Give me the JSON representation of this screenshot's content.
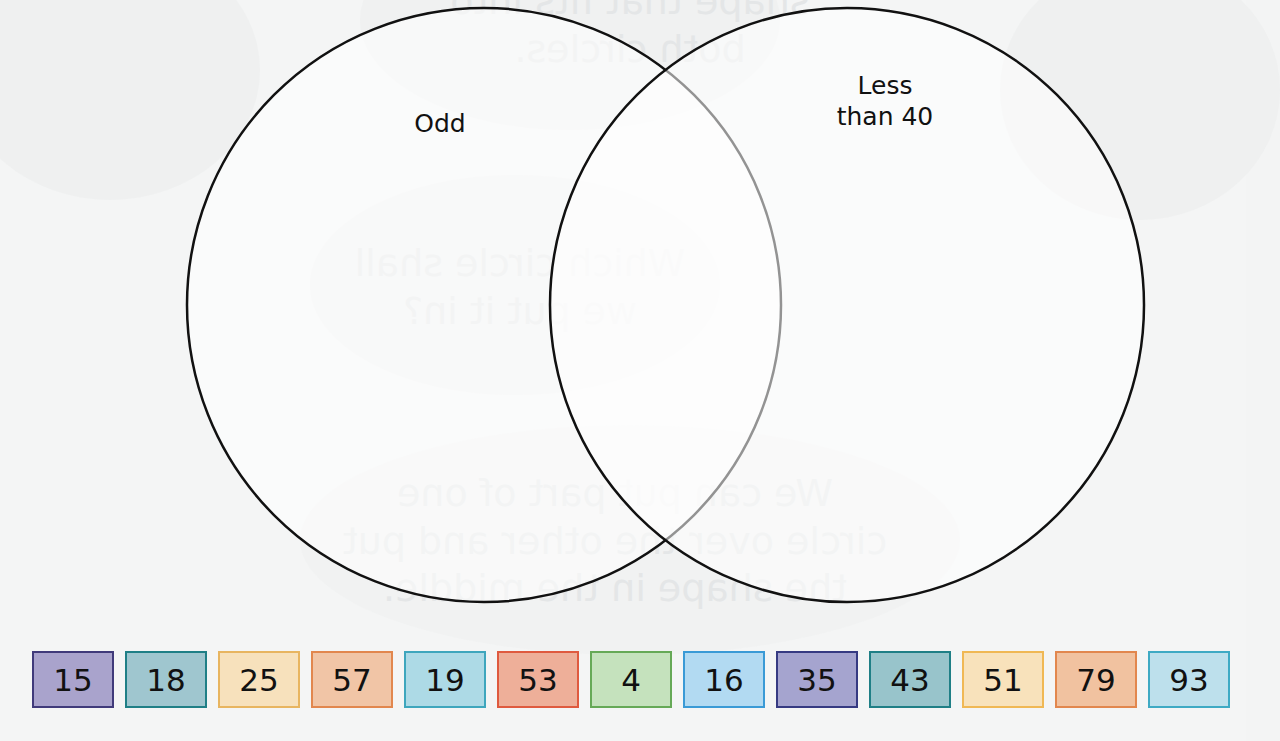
{
  "venn": {
    "left_set": {
      "label": "Odd",
      "cx": 484,
      "cy": 305,
      "r": 297
    },
    "right_set": {
      "label_line1": "Less",
      "label_line2": "than 40",
      "cx": 847,
      "cy": 305,
      "r": 297
    },
    "stroke_color": "#111111"
  },
  "background_bleed_text": {
    "top": [
      "shape that fits into",
      "both circles."
    ],
    "middle": [
      "Which circle shall",
      "we put it in?"
    ],
    "bottom": [
      "We can put part of one",
      "circle over the other and put",
      "the shape in the middle."
    ]
  },
  "number_tiles": [
    {
      "value": "15",
      "fill": "#a9a3cc",
      "border": "#403a7a"
    },
    {
      "value": "18",
      "fill": "#9fc6cf",
      "border": "#1f7f86"
    },
    {
      "value": "25",
      "fill": "#f7e1bc",
      "border": "#e8b560"
    },
    {
      "value": "57",
      "fill": "#f1c5a6",
      "border": "#e2874e"
    },
    {
      "value": "19",
      "fill": "#addae6",
      "border": "#3ea6bd"
    },
    {
      "value": "53",
      "fill": "#eeaf99",
      "border": "#df5a3f"
    },
    {
      "value": "4",
      "fill": "#c5e2bd",
      "border": "#66a957"
    },
    {
      "value": "16",
      "fill": "#b2daf2",
      "border": "#3a9ad6"
    },
    {
      "value": "35",
      "fill": "#a5a4cf",
      "border": "#363a82"
    },
    {
      "value": "43",
      "fill": "#98c4cb",
      "border": "#1f7f86"
    },
    {
      "value": "51",
      "fill": "#f8e2bb",
      "border": "#f0b854"
    },
    {
      "value": "79",
      "fill": "#f1c2a0",
      "border": "#e2874e"
    },
    {
      "value": "93",
      "fill": "#bde0ec",
      "border": "#3eaac4"
    }
  ]
}
